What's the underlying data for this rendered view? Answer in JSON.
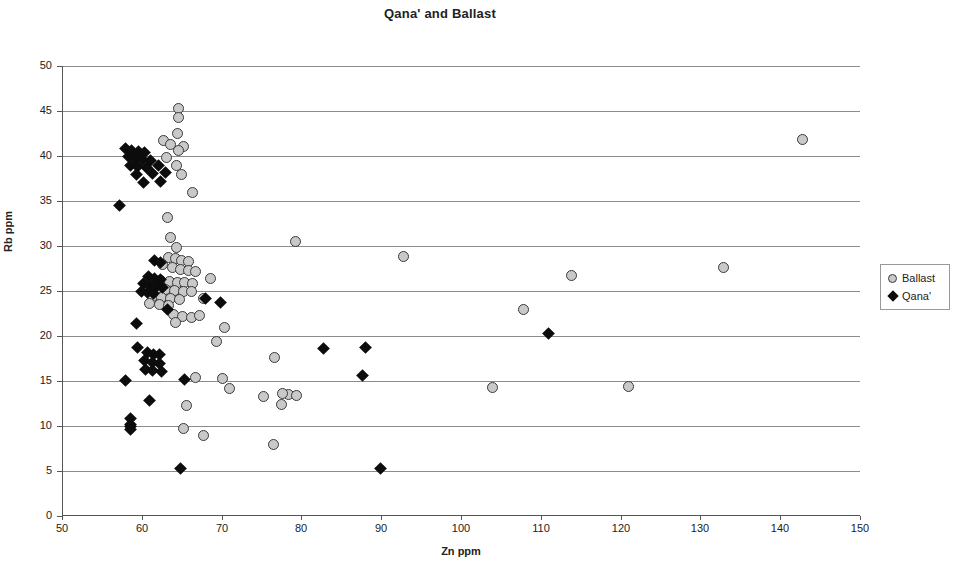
{
  "chart_data": {
    "type": "scatter",
    "title": "Qana' and Ballast",
    "xlabel": "Zn ppm",
    "ylabel": "Rb ppm",
    "xlim": [
      50,
      150
    ],
    "ylim": [
      0,
      50
    ],
    "xticks": [
      50,
      60,
      70,
      80,
      90,
      100,
      110,
      120,
      130,
      140,
      150
    ],
    "yticks": [
      0,
      5,
      10,
      15,
      20,
      25,
      30,
      35,
      40,
      45,
      50
    ],
    "grid": "horizontal",
    "legend_position": "right-outside",
    "series": [
      {
        "name": "Ballast",
        "marker": "circle",
        "color": "#c9c9c9",
        "edge_color": "#3a3a3a",
        "points": [
          [
            64.6,
            45.3
          ],
          [
            64.6,
            44.3
          ],
          [
            64.5,
            42.5
          ],
          [
            62.7,
            41.7
          ],
          [
            63.6,
            41.3
          ],
          [
            65.2,
            41.1
          ],
          [
            64.6,
            40.6
          ],
          [
            63.1,
            39.8
          ],
          [
            64.3,
            38.9
          ],
          [
            65.0,
            38.0
          ],
          [
            66.4,
            35.9
          ],
          [
            63.2,
            33.2
          ],
          [
            63.6,
            30.9
          ],
          [
            64.3,
            29.8
          ],
          [
            92.8,
            28.8
          ],
          [
            63.4,
            28.7
          ],
          [
            64.2,
            28.6
          ],
          [
            65.0,
            28.4
          ],
          [
            65.9,
            28.3
          ],
          [
            62.6,
            28.0
          ],
          [
            63.8,
            27.6
          ],
          [
            64.8,
            27.4
          ],
          [
            65.8,
            27.3
          ],
          [
            66.7,
            27.2
          ],
          [
            132.9,
            27.6
          ],
          [
            113.9,
            26.7
          ],
          [
            68.6,
            26.4
          ],
          [
            62.4,
            26.2
          ],
          [
            63.5,
            26.1
          ],
          [
            64.5,
            26.0
          ],
          [
            65.4,
            25.9
          ],
          [
            66.3,
            25.8
          ],
          [
            61.9,
            25.3
          ],
          [
            63.0,
            25.2
          ],
          [
            64.1,
            25.1
          ],
          [
            65.2,
            25.0
          ],
          [
            66.2,
            24.9
          ],
          [
            61.4,
            24.4
          ],
          [
            62.5,
            24.3
          ],
          [
            63.6,
            24.2
          ],
          [
            64.7,
            24.1
          ],
          [
            67.7,
            24.2
          ],
          [
            61.0,
            23.6
          ],
          [
            62.2,
            23.5
          ],
          [
            63.4,
            23.4
          ],
          [
            64.0,
            22.4
          ],
          [
            65.1,
            22.2
          ],
          [
            66.2,
            22.1
          ],
          [
            67.2,
            22.3
          ],
          [
            64.2,
            21.5
          ],
          [
            70.4,
            21.0
          ],
          [
            107.8,
            23.0
          ],
          [
            79.3,
            30.5
          ],
          [
            69.3,
            19.4
          ],
          [
            76.6,
            17.6
          ],
          [
            70.1,
            15.3
          ],
          [
            66.7,
            15.4
          ],
          [
            104.0,
            14.3
          ],
          [
            121.0,
            14.4
          ],
          [
            71.0,
            14.2
          ],
          [
            75.2,
            13.3
          ],
          [
            78.4,
            13.5
          ],
          [
            79.4,
            13.4
          ],
          [
            77.6,
            13.6
          ],
          [
            77.5,
            12.4
          ],
          [
            65.6,
            12.3
          ],
          [
            65.2,
            9.7
          ],
          [
            67.7,
            8.9
          ],
          [
            76.5,
            8.0
          ],
          [
            142.8,
            41.8
          ]
        ]
      },
      {
        "name": "Qana'",
        "marker": "diamond",
        "color": "#0c0c0c",
        "points": [
          [
            58.0,
            40.8
          ],
          [
            58.7,
            40.6
          ],
          [
            59.6,
            40.5
          ],
          [
            60.4,
            40.4
          ],
          [
            58.3,
            39.9
          ],
          [
            59.2,
            39.7
          ],
          [
            60.1,
            39.6
          ],
          [
            61.1,
            39.5
          ],
          [
            58.6,
            38.9
          ],
          [
            59.5,
            38.8
          ],
          [
            60.6,
            38.7
          ],
          [
            62.1,
            38.9
          ],
          [
            61.3,
            38.1
          ],
          [
            63.0,
            38.2
          ],
          [
            59.3,
            37.9
          ],
          [
            60.2,
            37.1
          ],
          [
            62.3,
            37.2
          ],
          [
            57.2,
            34.5
          ],
          [
            61.6,
            28.4
          ],
          [
            62.3,
            28.2
          ],
          [
            60.8,
            26.6
          ],
          [
            61.6,
            26.4
          ],
          [
            62.4,
            26.3
          ],
          [
            60.2,
            25.8
          ],
          [
            61.0,
            25.6
          ],
          [
            61.8,
            25.5
          ],
          [
            62.6,
            25.4
          ],
          [
            59.9,
            24.9
          ],
          [
            60.7,
            24.8
          ],
          [
            61.5,
            24.7
          ],
          [
            68.0,
            24.2
          ],
          [
            69.8,
            23.7
          ],
          [
            63.2,
            23.0
          ],
          [
            59.3,
            21.4
          ],
          [
            111.0,
            20.3
          ],
          [
            82.8,
            18.6
          ],
          [
            88.0,
            18.7
          ],
          [
            59.5,
            18.7
          ],
          [
            60.7,
            18.2
          ],
          [
            61.5,
            18.0
          ],
          [
            62.2,
            17.9
          ],
          [
            60.4,
            17.3
          ],
          [
            61.3,
            17.1
          ],
          [
            62.2,
            17.0
          ],
          [
            60.5,
            16.3
          ],
          [
            61.4,
            16.2
          ],
          [
            62.5,
            16.1
          ],
          [
            87.6,
            15.6
          ],
          [
            58.0,
            15.1
          ],
          [
            65.3,
            15.2
          ],
          [
            61.0,
            12.8
          ],
          [
            58.6,
            10.8
          ],
          [
            58.6,
            10.2
          ],
          [
            58.6,
            9.9
          ],
          [
            58.6,
            9.6
          ],
          [
            64.9,
            5.3
          ],
          [
            89.9,
            5.3
          ]
        ]
      }
    ]
  },
  "legend": {
    "items": [
      {
        "label": "Ballast",
        "marker": "circle"
      },
      {
        "label": "Qana'",
        "marker": "diamond"
      }
    ]
  }
}
